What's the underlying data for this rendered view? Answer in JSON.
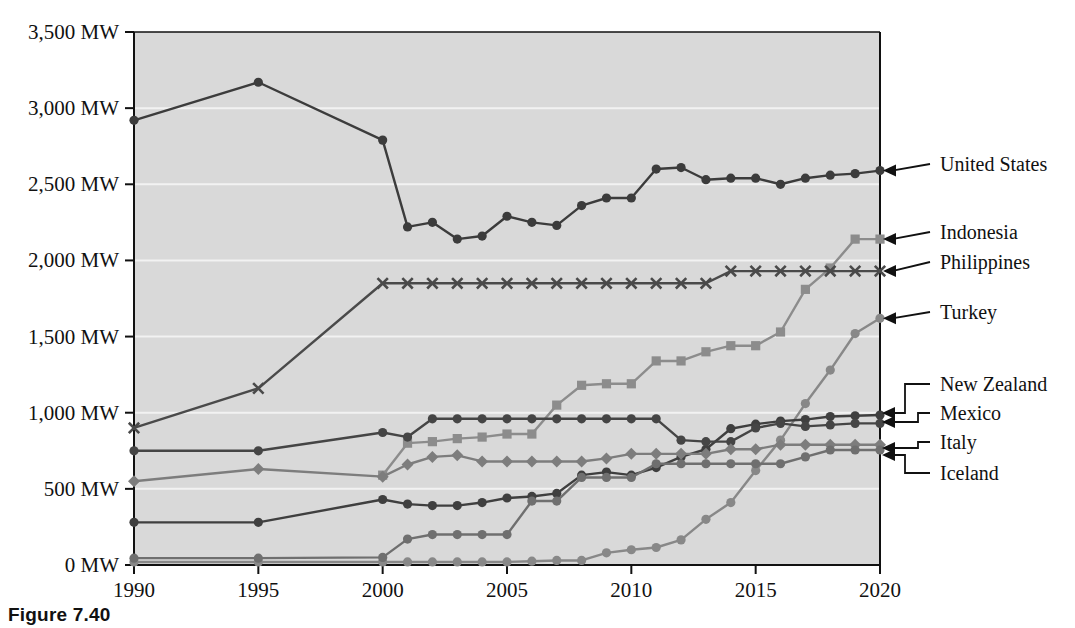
{
  "figure": {
    "caption": "Figure 7.40"
  },
  "chart_data": {
    "type": "line",
    "title": "",
    "xlabel": "",
    "ylabel": "",
    "xlim": [
      1990,
      2020
    ],
    "ylim": [
      0,
      3500
    ],
    "grid": true,
    "legend_position": "right-callouts",
    "plot_background": "#d9d9d9",
    "y_tick_labels": [
      "3,500 MW",
      "3,000 MW",
      "2,500 MW",
      "2,000 MW",
      "1,500 MW",
      "1,000 MW",
      "500 MW",
      "0 MW"
    ],
    "y_tick_values": [
      3500,
      3000,
      2500,
      2000,
      1500,
      1000,
      500,
      0
    ],
    "x_tick_labels": [
      "1990",
      "1995",
      "2000",
      "2005",
      "2010",
      "2015",
      "2020"
    ],
    "x_tick_values": [
      1990,
      1995,
      2000,
      2005,
      2010,
      2015,
      2020
    ],
    "series": [
      {
        "name": "United States",
        "color": "#3c3c3c",
        "marker": "circle",
        "x": [
          1990,
          1995,
          2000,
          2001,
          2002,
          2003,
          2004,
          2005,
          2006,
          2007,
          2008,
          2009,
          2010,
          2011,
          2012,
          2013,
          2014,
          2015,
          2016,
          2017,
          2018,
          2019,
          2020
        ],
        "values": [
          2920,
          3170,
          2790,
          2220,
          2250,
          2140,
          2160,
          2290,
          2250,
          2230,
          2360,
          2410,
          2410,
          2600,
          2610,
          2530,
          2540,
          2540,
          2500,
          2540,
          2560,
          2570,
          2590
        ]
      },
      {
        "name": "Indonesia",
        "color": "#8c8c8c",
        "marker": "square",
        "x": [
          2000,
          2001,
          2002,
          2003,
          2004,
          2005,
          2006,
          2007,
          2008,
          2009,
          2010,
          2011,
          2012,
          2013,
          2014,
          2015,
          2016,
          2017,
          2018,
          2019,
          2020
        ],
        "values": [
          590,
          800,
          810,
          830,
          840,
          860,
          860,
          1050,
          1180,
          1190,
          1190,
          1340,
          1340,
          1400,
          1440,
          1440,
          1530,
          1810,
          1950,
          2140,
          2140
        ]
      },
      {
        "name": "Philippines",
        "color": "#4a4a4a",
        "marker": "x",
        "x": [
          1990,
          1995,
          2000,
          2001,
          2002,
          2003,
          2004,
          2005,
          2006,
          2007,
          2008,
          2009,
          2010,
          2011,
          2012,
          2013,
          2014,
          2015,
          2016,
          2017,
          2018,
          2019,
          2020
        ],
        "values": [
          900,
          1160,
          1850,
          1850,
          1850,
          1850,
          1850,
          1850,
          1850,
          1850,
          1850,
          1850,
          1850,
          1850,
          1850,
          1850,
          1930,
          1930,
          1930,
          1930,
          1930,
          1930,
          1930
        ]
      },
      {
        "name": "Turkey",
        "color": "#888888",
        "marker": "circle",
        "x": [
          1990,
          1995,
          2000,
          2001,
          2002,
          2003,
          2004,
          2005,
          2006,
          2007,
          2008,
          2009,
          2010,
          2011,
          2012,
          2013,
          2014,
          2015,
          2016,
          2017,
          2018,
          2019,
          2020
        ],
        "values": [
          20,
          20,
          20,
          20,
          20,
          20,
          20,
          20,
          25,
          30,
          30,
          80,
          100,
          115,
          165,
          300,
          410,
          620,
          820,
          1060,
          1280,
          1520,
          1620
        ]
      },
      {
        "name": "New Zealand",
        "color": "#3f3f3f",
        "marker": "circle",
        "x": [
          1990,
          1995,
          2000,
          2001,
          2002,
          2003,
          2004,
          2005,
          2006,
          2007,
          2008,
          2009,
          2010,
          2011,
          2012,
          2013,
          2014,
          2015,
          2016,
          2017,
          2018,
          2019,
          2020
        ],
        "values": [
          280,
          280,
          430,
          400,
          390,
          390,
          410,
          440,
          450,
          470,
          590,
          610,
          590,
          640,
          710,
          760,
          895,
          925,
          945,
          955,
          975,
          980,
          985
        ]
      },
      {
        "name": "Mexico",
        "color": "#454545",
        "marker": "circle",
        "x": [
          1990,
          1995,
          2000,
          2001,
          2002,
          2003,
          2004,
          2005,
          2006,
          2007,
          2008,
          2009,
          2010,
          2011,
          2012,
          2013,
          2014,
          2015,
          2016,
          2017,
          2018,
          2019,
          2020
        ],
        "values": [
          750,
          750,
          870,
          840,
          960,
          960,
          960,
          960,
          960,
          960,
          960,
          960,
          960,
          960,
          820,
          810,
          810,
          900,
          930,
          910,
          920,
          930,
          930
        ]
      },
      {
        "name": "Italy",
        "color": "#7d7d7d",
        "marker": "diamond",
        "x": [
          1990,
          1995,
          2000,
          2001,
          2002,
          2003,
          2004,
          2005,
          2006,
          2007,
          2008,
          2009,
          2010,
          2011,
          2012,
          2013,
          2014,
          2015,
          2016,
          2017,
          2018,
          2019,
          2020
        ],
        "values": [
          550,
          630,
          580,
          660,
          710,
          720,
          680,
          680,
          680,
          680,
          680,
          700,
          730,
          730,
          730,
          730,
          760,
          760,
          790,
          790,
          790,
          790,
          790
        ]
      },
      {
        "name": "Iceland",
        "color": "#6f6f6f",
        "marker": "circle",
        "x": [
          1990,
          1995,
          2000,
          2001,
          2002,
          2003,
          2004,
          2005,
          2006,
          2007,
          2008,
          2009,
          2010,
          2011,
          2012,
          2013,
          2014,
          2015,
          2016,
          2017,
          2018,
          2019,
          2020
        ],
        "values": [
          45,
          45,
          50,
          170,
          200,
          200,
          200,
          200,
          420,
          420,
          575,
          575,
          575,
          665,
          665,
          665,
          665,
          665,
          665,
          710,
          755,
          755,
          755
        ]
      }
    ],
    "callouts": [
      {
        "label": "United States",
        "series": "United States"
      },
      {
        "label": "Indonesia",
        "series": "Indonesia"
      },
      {
        "label": "Philippines",
        "series": "Philippines"
      },
      {
        "label": "Turkey",
        "series": "Turkey"
      },
      {
        "label": "New Zealand",
        "series": "New Zealand"
      },
      {
        "label": "Mexico",
        "series": "Mexico"
      },
      {
        "label": "Italy",
        "series": "Italy"
      },
      {
        "label": "Iceland",
        "series": "Iceland"
      }
    ]
  }
}
